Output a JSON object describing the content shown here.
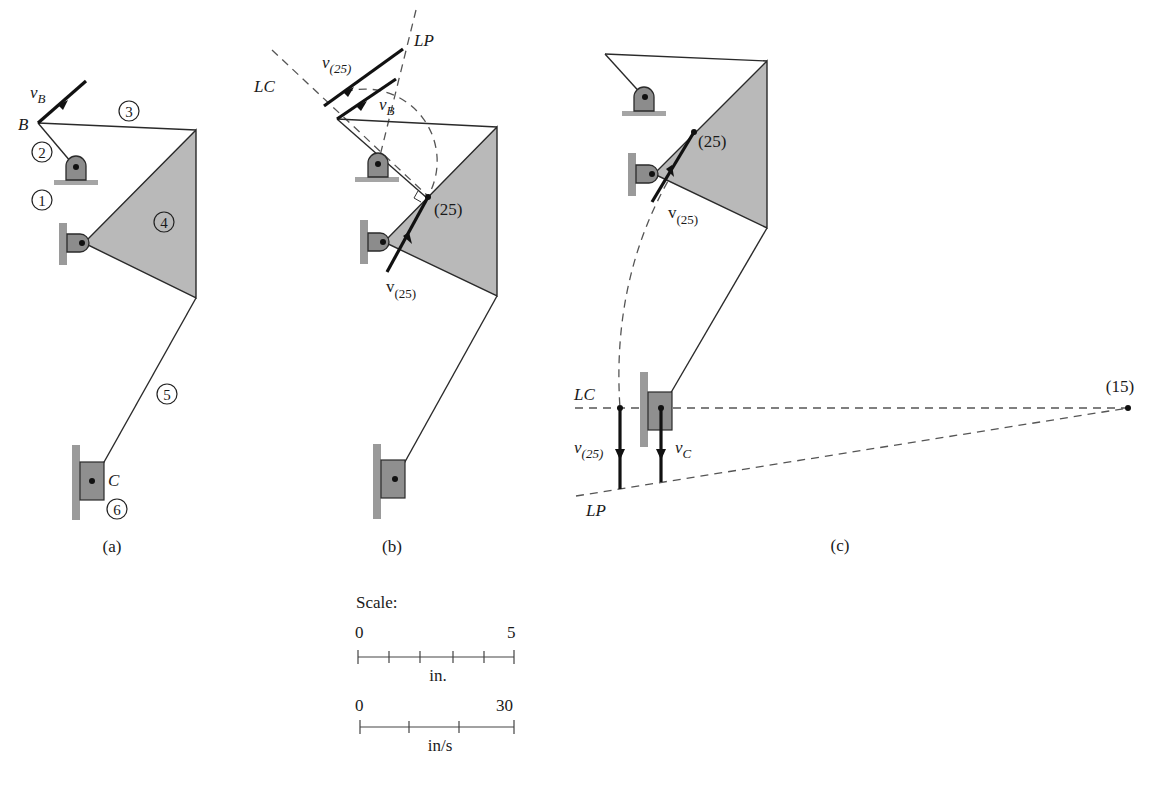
{
  "figure": {
    "panels": [
      {
        "id": "a",
        "caption": "(a)",
        "labels": {
          "vB": "v",
          "vB_sub": "B",
          "B": "B",
          "C": "C"
        },
        "link_numbers": [
          "1",
          "2",
          "3",
          "4",
          "5",
          "6"
        ]
      },
      {
        "id": "b",
        "caption": "(b)",
        "labels": {
          "LC": "LC",
          "LP": "LP",
          "v25_top": "v",
          "v25_top_sub": "(25)",
          "vB": "v",
          "vB_sub": "B",
          "point25": "(25)",
          "v25_bottom": "v",
          "v25_bottom_sub": "(25)"
        }
      },
      {
        "id": "c",
        "caption": "(c)",
        "labels": {
          "point25": "(25)",
          "v25": "v",
          "v25_sub": "(25)",
          "LC": "LC",
          "LP": "LP",
          "v25_low": "v",
          "v25_low_sub": "(25)",
          "vC": "v",
          "vC_sub": "C",
          "point15": "(15)"
        }
      }
    ],
    "scale": {
      "title": "Scale:",
      "length": {
        "min": "0",
        "max": "5",
        "unit": "in.",
        "divisions": 5
      },
      "velocity": {
        "min": "0",
        "max": "30",
        "unit": "in/s",
        "divisions": 3
      }
    }
  }
}
